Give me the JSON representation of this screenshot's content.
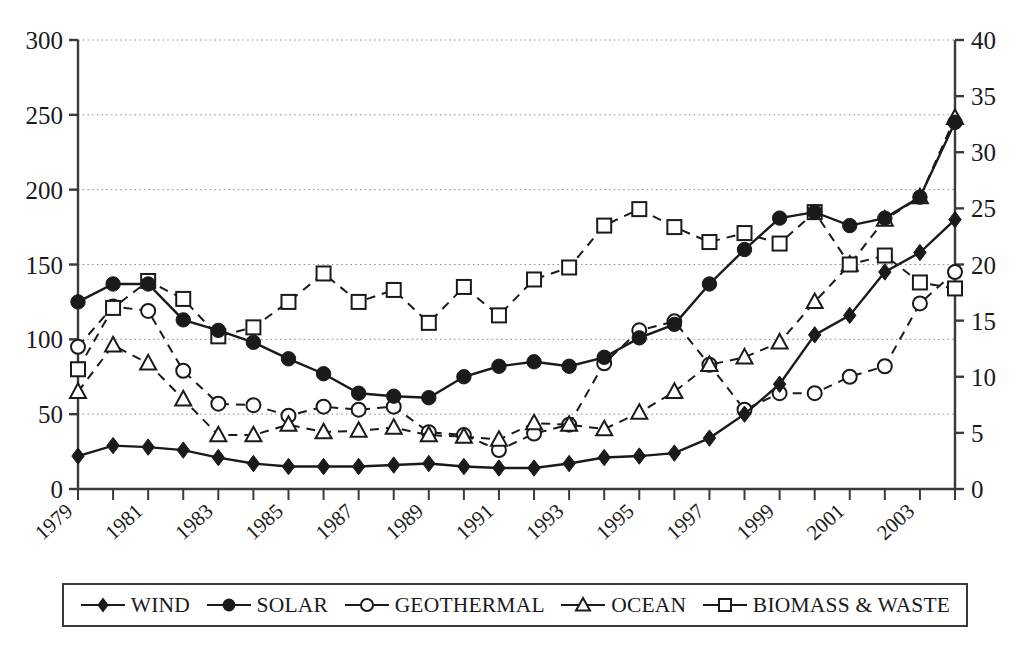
{
  "chart_data": {
    "type": "line",
    "title": "",
    "xlabel": "",
    "ylabel": "",
    "grid": true,
    "legend_position": "bottom",
    "x": [
      1979,
      1980,
      1981,
      1982,
      1983,
      1984,
      1985,
      1986,
      1987,
      1988,
      1989,
      1990,
      1991,
      1992,
      1993,
      1994,
      1995,
      1996,
      1997,
      1998,
      1999,
      2000,
      2001,
      2002,
      2003,
      2004
    ],
    "x_tick_labels": [
      "1979",
      "1981",
      "1983",
      "1985",
      "1987",
      "1989",
      "1991",
      "1993",
      "1995",
      "1997",
      "1999",
      "2001",
      "2003"
    ],
    "left_axis": {
      "label": "",
      "min": 0,
      "max": 300,
      "step": 50,
      "ticks": [
        "0",
        "50",
        "100",
        "150",
        "200",
        "250",
        "300"
      ]
    },
    "right_axis": {
      "label": "",
      "min": 0,
      "max": 40,
      "step": 5,
      "ticks": [
        "0",
        "5",
        "10",
        "15",
        "20",
        "25",
        "30",
        "35",
        "40"
      ]
    },
    "series": [
      {
        "name": "WIND",
        "marker": "filled-diamond",
        "line": "solid",
        "axis": "left",
        "values": [
          22,
          29,
          28,
          26,
          21,
          17,
          15,
          15,
          15,
          16,
          17,
          15,
          14,
          14,
          17,
          21,
          22,
          24,
          34,
          50,
          70,
          103,
          116,
          145,
          158,
          180
        ]
      },
      {
        "name": "SOLAR",
        "marker": "filled-circle",
        "line": "solid",
        "axis": "left",
        "values": [
          125,
          137,
          137,
          113,
          106,
          98,
          87,
          77,
          64,
          62,
          61,
          75,
          82,
          85,
          82,
          88,
          101,
          110,
          137,
          160,
          181,
          185,
          176,
          181,
          195,
          245
        ]
      },
      {
        "name": "GEOTHERMAL",
        "marker": "open-circle",
        "line": "dashed",
        "axis": "left",
        "values": [
          95,
          122,
          119,
          79,
          57,
          56,
          49,
          55,
          53,
          55,
          38,
          36,
          26,
          37,
          43,
          84,
          106,
          112,
          83,
          53,
          64,
          64,
          75,
          82,
          124,
          145
        ]
      },
      {
        "name": "OCEAN",
        "marker": "open-triangle",
        "line": "dashed",
        "axis": "left",
        "values": [
          65,
          96,
          84,
          60,
          36,
          36,
          43,
          38,
          39,
          41,
          36,
          35,
          33,
          44,
          43,
          40,
          51,
          65,
          83,
          88,
          98,
          125,
          150,
          180,
          195,
          248
        ]
      },
      {
        "name": "BIOMASS & WASTE",
        "marker": "open-square",
        "line": "dashed",
        "axis": "left",
        "values": [
          80,
          121,
          139,
          127,
          102,
          108,
          125,
          144,
          125,
          133,
          111,
          135,
          116,
          140,
          148,
          176,
          187,
          175,
          165,
          171,
          164,
          185,
          150,
          156,
          138,
          134
        ]
      }
    ]
  },
  "legend": {
    "items": [
      {
        "label": "WIND",
        "marker": "filled-diamond"
      },
      {
        "label": "SOLAR",
        "marker": "filled-circle"
      },
      {
        "label": "GEOTHERMAL",
        "marker": "open-circle"
      },
      {
        "label": "OCEAN",
        "marker": "open-triangle"
      },
      {
        "label": "BIOMASS & WASTE",
        "marker": "open-square"
      }
    ]
  },
  "colors": {
    "ink": "#1a1a1a",
    "grid": "#8a8a8a",
    "axis": "#3a3a3a",
    "background": "#ffffff"
  }
}
